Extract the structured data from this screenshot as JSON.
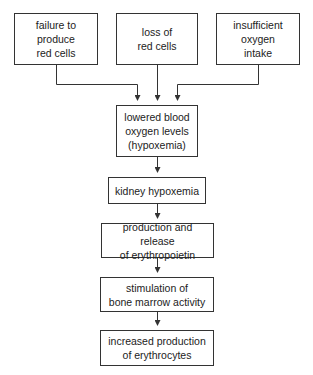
{
  "diagram": {
    "type": "flowchart",
    "causes": [
      {
        "id": "cause-failure",
        "label": "failure to\nproduce\nred cells"
      },
      {
        "id": "cause-loss",
        "label": "loss of\nred cells"
      },
      {
        "id": "cause-insufficient",
        "label": "insufficient\noxygen\nintake"
      }
    ],
    "steps": [
      {
        "id": "step-hypoxemia",
        "label": "lowered blood\noxygen levels\n(hypoxemia)"
      },
      {
        "id": "step-kidney",
        "label": "kidney hypoxemia"
      },
      {
        "id": "step-erythropoietin",
        "label": "production and release\nof erythropoietin"
      },
      {
        "id": "step-bone-marrow",
        "label": "stimulation of\nbone marrow activity"
      },
      {
        "id": "step-erythrocytes",
        "label": "increased production\nof erythrocytes"
      }
    ],
    "edges": [
      {
        "from": "cause-failure",
        "to": "step-hypoxemia"
      },
      {
        "from": "cause-loss",
        "to": "step-hypoxemia"
      },
      {
        "from": "cause-insufficient",
        "to": "step-hypoxemia"
      },
      {
        "from": "step-hypoxemia",
        "to": "step-kidney"
      },
      {
        "from": "step-kidney",
        "to": "step-erythropoietin"
      },
      {
        "from": "step-erythropoietin",
        "to": "step-bone-marrow"
      },
      {
        "from": "step-bone-marrow",
        "to": "step-erythrocytes"
      }
    ],
    "colors": {
      "line": "#333333",
      "box_border": "#333333",
      "background": "#ffffff",
      "text": "#222222"
    }
  }
}
